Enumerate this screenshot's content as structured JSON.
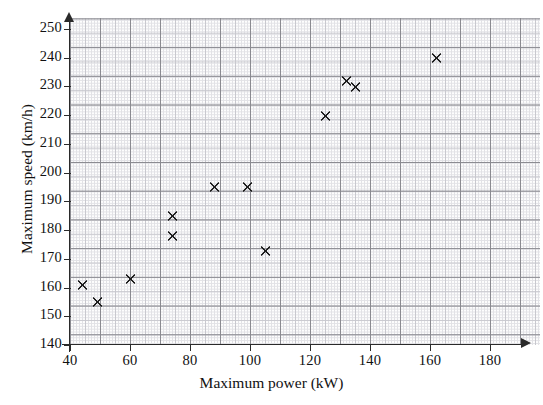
{
  "chart_data": {
    "type": "scatter",
    "title": "",
    "xlabel": "Maximum power (kW)",
    "ylabel": "Maximum speed (km/h)",
    "xlim": [
      40,
      190
    ],
    "ylim": [
      140,
      252
    ],
    "xticks": [
      40,
      60,
      80,
      100,
      120,
      140,
      160,
      180
    ],
    "yticks": [
      140,
      150,
      160,
      170,
      180,
      190,
      200,
      210,
      220,
      230,
      240,
      250
    ],
    "grid": true,
    "grid_style": "graph-paper",
    "legend": "none",
    "marker": "x",
    "marker_color": "#1b1b1b",
    "points": [
      {
        "x": 44,
        "y": 161
      },
      {
        "x": 49,
        "y": 155
      },
      {
        "x": 60,
        "y": 163
      },
      {
        "x": 74,
        "y": 185
      },
      {
        "x": 74,
        "y": 178
      },
      {
        "x": 88,
        "y": 195
      },
      {
        "x": 99,
        "y": 195
      },
      {
        "x": 105,
        "y": 173
      },
      {
        "x": 125,
        "y": 220
      },
      {
        "x": 132,
        "y": 232
      },
      {
        "x": 135,
        "y": 230
      },
      {
        "x": 162,
        "y": 240
      }
    ]
  },
  "axes": {
    "x_tick_labels": [
      "40",
      "60",
      "80",
      "100",
      "120",
      "140",
      "160",
      "180"
    ],
    "y_tick_labels": [
      "140",
      "150",
      "160",
      "170",
      "180",
      "190",
      "200",
      "210",
      "220",
      "230",
      "240",
      "250"
    ],
    "x_title": "Maximum power (kW)",
    "y_title": "Maximum speed (km/h)"
  }
}
